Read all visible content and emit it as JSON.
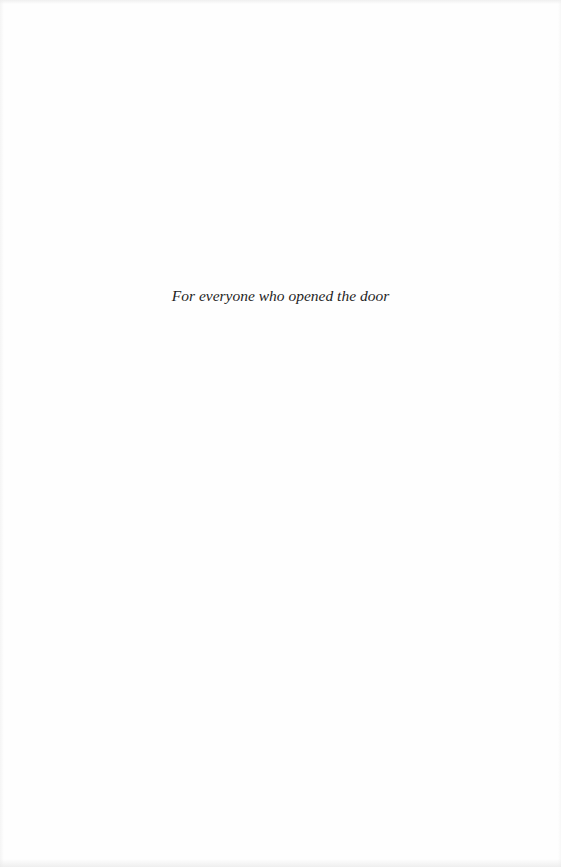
{
  "page": {
    "type": "dedication",
    "dedication_text": "For everyone who opened the door"
  },
  "colors": {
    "background": "#fefefe",
    "text": "#1e1e1e"
  }
}
